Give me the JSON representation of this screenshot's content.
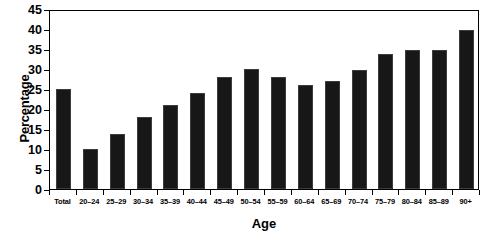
{
  "chart_data": {
    "type": "bar",
    "title": "",
    "xlabel": "Age",
    "ylabel": "Percentage",
    "categories": [
      "Total",
      "20–24",
      "25–29",
      "30–34",
      "35–39",
      "40–44",
      "45–49",
      "50–54",
      "55–59",
      "60–64",
      "65–69",
      "70–74",
      "75–79",
      "80–84",
      "85–89",
      "90+"
    ],
    "values": [
      25,
      10,
      13.7,
      18,
      21,
      24,
      28,
      30,
      28,
      26,
      27,
      29.8,
      33.7,
      34.8,
      34.8,
      39.8
    ],
    "ylim": [
      0,
      45
    ],
    "ytick_values": [
      0,
      5,
      10,
      15,
      20,
      25,
      30,
      35,
      40,
      45
    ],
    "ytick_labels": [
      "0",
      "5",
      "10",
      "15",
      "20",
      "25",
      "30",
      "35",
      "40",
      "45"
    ],
    "grid": false,
    "legend": null,
    "bar_color": "#171717",
    "axis_color": "#000000",
    "background_color": "#ffffff"
  }
}
